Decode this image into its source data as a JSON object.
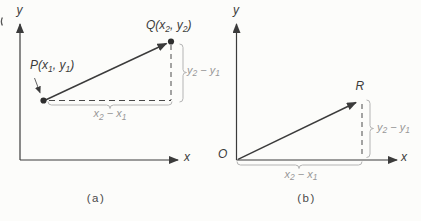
{
  "figure": {
    "colors": {
      "ink": "#3b3b3b",
      "dash": "#4a4a4a",
      "muted_text": "#979797",
      "brace": "#b4b4b4",
      "background": "#fcfcfa"
    },
    "panels": [
      {
        "caption": "(a)",
        "y_axis_label": "y",
        "x_axis_label": "x",
        "point_p": {
          "t1": "P(x",
          "s1": "1",
          "t2": ", y",
          "s2": "1",
          "t3": ")"
        },
        "point_q": {
          "t1": "Q(x",
          "s1": "2",
          "t2": ", y",
          "s2": "2",
          "t3": ")"
        },
        "delta_x": {
          "t1": "x",
          "s1": "2",
          "t2": " − x",
          "s2": "1"
        },
        "delta_y": {
          "t1": "y",
          "s1": "2",
          "t2": " − y",
          "s2": "1"
        }
      },
      {
        "caption": "(b)",
        "y_axis_label": "y",
        "x_axis_label": "x",
        "origin_label": "O",
        "point_r": "R",
        "delta_x": {
          "t1": "x",
          "s1": "2",
          "t2": " − x",
          "s2": "1"
        },
        "delta_y": {
          "t1": "y",
          "s1": "2",
          "t2": " − y",
          "s2": "1"
        }
      }
    ]
  }
}
